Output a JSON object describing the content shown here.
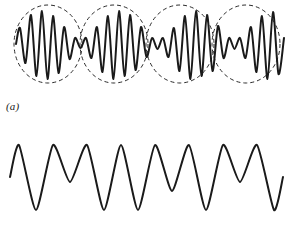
{
  "figure": {
    "background_color": "#ffffff",
    "stroke_color": "#1a1a1a",
    "envelope_color": "#2b2b2b",
    "panels": [
      {
        "id": "a",
        "label": "(a)",
        "description": "Amplitude-modulated beat waveform with dashed elliptical envelopes",
        "has_envelope": true
      },
      {
        "id": "b",
        "label": "(b)",
        "description": "Beat waveform without envelopes",
        "has_envelope": false
      }
    ]
  },
  "chart_data": [
    {
      "type": "line",
      "id": "panel-a-wave",
      "title": "",
      "subtitle": "",
      "xlabel": "",
      "ylabel": "",
      "xlim": [
        0,
        290
      ],
      "ylim": [
        0,
        95
      ],
      "grid": false,
      "legend": null,
      "annotations": [
        "(a)"
      ],
      "baseline_y": 44,
      "series": [
        {
          "name": "modulated-wave",
          "stroke_width": 2.0,
          "points_x": [
            16,
            20,
            25.5,
            31,
            36.5,
            42,
            47.5,
            53,
            58.5,
            64,
            69.5,
            75,
            80.5,
            86,
            91.5,
            97,
            102.5,
            108,
            113.5,
            119,
            124.5,
            130,
            135.5,
            141,
            146.5,
            152,
            157.5,
            163,
            168.5,
            174,
            179.5,
            185,
            190.5,
            196,
            201.5,
            207,
            212.5,
            218,
            223.5,
            229,
            234.5,
            240,
            245.5,
            251,
            256.5,
            262,
            267.5,
            273,
            278.5,
            284
          ],
          "points_y": [
            44,
            28,
            63,
            15,
            76,
            11,
            79,
            16,
            73,
            27,
            59,
            38,
            48,
            38,
            58,
            27,
            72,
            16,
            79,
            11,
            76,
            15,
            70,
            27,
            57,
            38,
            49,
            38,
            57,
            28,
            71,
            16,
            79,
            11,
            76,
            15,
            71,
            26,
            58,
            38,
            49,
            38,
            58,
            27,
            72,
            16,
            79,
            12,
            74,
            38
          ]
        }
      ],
      "envelopes": [
        {
          "name": "envelope-ellipse-1",
          "cx": 48,
          "cy": 44,
          "rx": 34,
          "ry": 39,
          "style": "dashed"
        },
        {
          "name": "envelope-ellipse-2",
          "cx": 114,
          "cy": 44,
          "rx": 34,
          "ry": 39,
          "style": "dashed"
        },
        {
          "name": "envelope-ellipse-3",
          "cx": 180,
          "cy": 44,
          "rx": 34,
          "ry": 39,
          "style": "dashed"
        },
        {
          "name": "envelope-ellipse-4",
          "cx": 246,
          "cy": 44,
          "rx": 34,
          "ry": 39,
          "style": "dashed"
        }
      ]
    },
    {
      "type": "line",
      "id": "panel-b-wave",
      "title": "",
      "subtitle": "",
      "xlabel": "",
      "ylabel": "",
      "xlim": [
        0,
        290
      ],
      "ylim": [
        0,
        123
      ],
      "grid": false,
      "legend": null,
      "annotations": [
        "(b)"
      ],
      "baseline_y": 57,
      "series": [
        {
          "name": "beat-wave",
          "stroke_width": 2.0,
          "points_x": [
            10,
            19,
            36,
            53,
            70,
            87,
            104,
            121,
            138,
            155,
            172,
            189,
            206,
            223,
            240,
            257,
            274,
            283
          ],
          "points_y": [
            57,
            25,
            90,
            25,
            62,
            25,
            90,
            25,
            90,
            25,
            71,
            25,
            90,
            25,
            62,
            25,
            90,
            57
          ]
        }
      ],
      "envelopes": []
    }
  ]
}
